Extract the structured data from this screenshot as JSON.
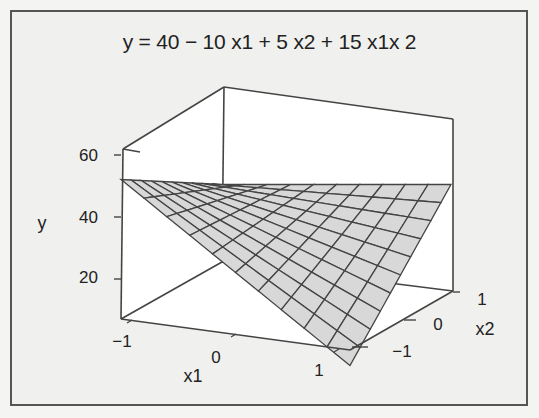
{
  "chart_data": {
    "type": "surface",
    "title": "y = 40 − 10 x1 + 5 x2 + 15 x1x 2",
    "equation": {
      "intercept": 40,
      "x1": -10,
      "x2": 5,
      "x1x2": 15
    },
    "xlabel": "x1",
    "ylabel": "y",
    "zlabel": "x2",
    "x1_ticks": [
      "−1",
      "0",
      "1"
    ],
    "x2_ticks": [
      "−1",
      "0",
      "1"
    ],
    "y_ticks": [
      "20",
      "40",
      "60"
    ],
    "x1_range": [
      -1,
      1
    ],
    "x2_range": [
      -1,
      1
    ],
    "y_range": [
      15,
      65
    ],
    "grid_lines_per_axis": 11,
    "corner_values": [
      {
        "x1": -1,
        "x2": -1,
        "y": 60
      },
      {
        "x1": -1,
        "x2": 1,
        "y": 40
      },
      {
        "x1": 1,
        "x2": -1,
        "y": 20
      },
      {
        "x1": 1,
        "x2": 1,
        "y": 50
      }
    ],
    "surface_color": "#d8d8d8",
    "grid_color": "#444444"
  }
}
